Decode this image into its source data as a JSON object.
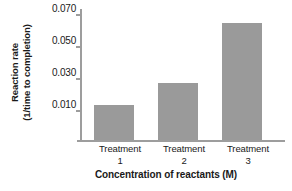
{
  "chart_data": {
    "type": "bar",
    "title": "",
    "categories": [
      "Treatment 1",
      "Treatment 2",
      "Treatment 3"
    ],
    "category_lines": [
      {
        "line1": "Treatment",
        "line2": "1"
      },
      {
        "line1": "Treatment",
        "line2": "2"
      },
      {
        "line1": "Treatment",
        "line2": "3"
      }
    ],
    "values": [
      0.021,
      0.034,
      0.069
    ],
    "xlabel": "Concentration of reactants (M)",
    "ylabel": "Reaction rate (1/time to completion)",
    "ylabel_lines": {
      "line1": "Reaction rate",
      "line2": "(1/time to completion)"
    },
    "ytick_labels": [
      "0.070",
      "0.050",
      "0.030",
      "0.010"
    ],
    "ytick_values": [
      0.07,
      0.05,
      0.03,
      0.01
    ],
    "ylim": [
      0.0,
      0.0775
    ],
    "grid": false,
    "legend": null,
    "colors": {
      "bar": "#9a9a9a",
      "axis": "#9d9d9d",
      "text": "#1a1a1a",
      "background": "#ffffff"
    }
  }
}
